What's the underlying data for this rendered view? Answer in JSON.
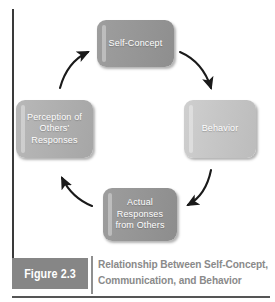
{
  "figure": {
    "tag_label": "Figure 2.3",
    "caption_line1": "Relationship Between Self-Concept,",
    "caption_line2": "Communication, and Behavior"
  },
  "diagram": {
    "type": "cycle",
    "direction": "clockwise",
    "nodes": [
      {
        "id": "self-concept",
        "label": "Self-Concept",
        "position": "top",
        "color": "#979797"
      },
      {
        "id": "behavior",
        "label": "Behavior",
        "position": "right",
        "color": "#c6c6c6"
      },
      {
        "id": "actual-responses",
        "label": "Actual Responses from Others",
        "position": "bottom",
        "color": "#969696"
      },
      {
        "id": "perception",
        "label": "Perception of Others' Responses",
        "position": "left",
        "color": "#b0b0b0"
      }
    ],
    "edges": [
      {
        "id": "self-concept-to-behavior",
        "from": "self-concept",
        "to": "behavior"
      },
      {
        "id": "behavior-to-actual-responses",
        "from": "behavior",
        "to": "actual-responses"
      },
      {
        "id": "actual-responses-to-perception",
        "from": "actual-responses",
        "to": "perception"
      },
      {
        "id": "perception-to-self-concept",
        "from": "perception",
        "to": "self-concept"
      }
    ],
    "arrow_color": "#1a1a1a"
  }
}
